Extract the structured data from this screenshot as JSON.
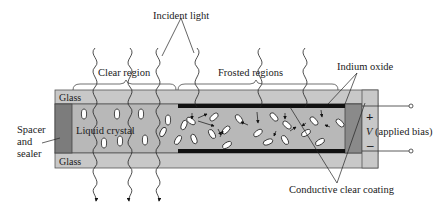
{
  "diagram": {
    "labels": {
      "incident_light": "Incident light",
      "clear_region": "Clear region",
      "frosted_regions": "Frosted regions",
      "indium_oxide": "Indium oxide",
      "glass_top": "Glass",
      "glass_bottom": "Glass",
      "liquid_crystal": "Liquid crystal",
      "spacer_line1": "Spacer",
      "spacer_line2": "and",
      "spacer_line3": "sealer",
      "plus": "+",
      "minus": "–",
      "voltage_symbol": "V",
      "voltage_text": " (applied bias)",
      "conductive_coating": "Conductive clear coating"
    },
    "colors": {
      "glass": "#c8c8c8",
      "liquid_crystal": "#b4b4b4",
      "spacer": "#7c7c7c",
      "electrode": "#111111",
      "molecule": "#ffffff",
      "outline": "#333333"
    }
  }
}
